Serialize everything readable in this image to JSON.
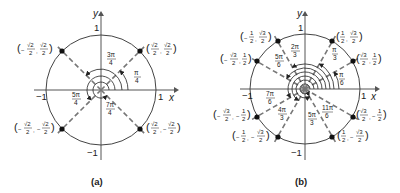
{
  "panels": [
    {
      "id": "a",
      "caption": "(a)",
      "axis_x_label": "x",
      "axis_y_label": "y",
      "tick_pos_x": "1",
      "tick_neg_x": "−1",
      "tick_pos_y": "1",
      "tick_neg_y": "−1",
      "points": [
        {
          "angle_deg": 45,
          "x_num": "√2",
          "x_den": "2",
          "x_sign": "",
          "y_num": "√2",
          "y_den": "2",
          "y_sign": ""
        },
        {
          "angle_deg": 135,
          "x_num": "√2",
          "x_den": "2",
          "x_sign": "−",
          "y_num": "√2",
          "y_den": "2",
          "y_sign": ""
        },
        {
          "angle_deg": 225,
          "x_num": "√2",
          "x_den": "2",
          "x_sign": "−",
          "y_num": "√2",
          "y_den": "2",
          "y_sign": "−"
        },
        {
          "angle_deg": 315,
          "x_num": "√2",
          "x_den": "2",
          "x_sign": "",
          "y_num": "√2",
          "y_den": "2",
          "y_sign": "−"
        }
      ],
      "angle_labels": [
        {
          "num": "π",
          "den": "4"
        },
        {
          "num": "3π",
          "den": "4"
        },
        {
          "num": "5π",
          "den": "4"
        },
        {
          "num": "7π",
          "den": "4"
        }
      ]
    },
    {
      "id": "b",
      "caption": "(b)",
      "axis_x_label": "x",
      "axis_y_label": "y",
      "tick_pos_x": "1",
      "tick_neg_x": "−1",
      "tick_pos_y": "1",
      "tick_neg_y": "−1",
      "points": [
        {
          "angle_deg": 30,
          "x_num": "√3",
          "x_den": "2",
          "x_sign": "",
          "y_num": "1",
          "y_den": "2",
          "y_sign": ""
        },
        {
          "angle_deg": 60,
          "x_num": "1",
          "x_den": "2",
          "x_sign": "",
          "y_num": "√3",
          "y_den": "2",
          "y_sign": ""
        },
        {
          "angle_deg": 120,
          "x_num": "1",
          "x_den": "2",
          "x_sign": "−",
          "y_num": "√3",
          "y_den": "2",
          "y_sign": ""
        },
        {
          "angle_deg": 150,
          "x_num": "√3",
          "x_den": "2",
          "x_sign": "−",
          "y_num": "1",
          "y_den": "2",
          "y_sign": ""
        },
        {
          "angle_deg": 210,
          "x_num": "√3",
          "x_den": "2",
          "x_sign": "−",
          "y_num": "1",
          "y_den": "2",
          "y_sign": "−"
        },
        {
          "angle_deg": 240,
          "x_num": "1",
          "x_den": "2",
          "x_sign": "−",
          "y_num": "√3",
          "y_den": "2",
          "y_sign": "−"
        },
        {
          "angle_deg": 300,
          "x_num": "1",
          "x_den": "2",
          "x_sign": "",
          "y_num": "√3",
          "y_den": "2",
          "y_sign": "−"
        },
        {
          "angle_deg": 330,
          "x_num": "√3",
          "x_den": "2",
          "x_sign": "",
          "y_num": "1",
          "y_den": "2",
          "y_sign": "−"
        }
      ],
      "angle_labels": [
        {
          "num": "π",
          "den": "6"
        },
        {
          "num": "π",
          "den": "3"
        },
        {
          "num": "2π",
          "den": "3"
        },
        {
          "num": "5π",
          "den": "6"
        },
        {
          "num": "7π",
          "den": "6"
        },
        {
          "num": "4π",
          "den": "3"
        },
        {
          "num": "5π",
          "den": "3"
        },
        {
          "num": "11π",
          "den": "6"
        }
      ]
    }
  ]
}
